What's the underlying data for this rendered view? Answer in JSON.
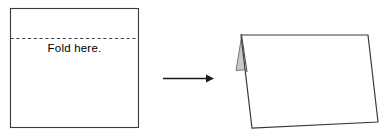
{
  "diagram": {
    "background_color": "#ffffff",
    "stroke_color": "#3a3a3a",
    "fold_crease_color": "#444444",
    "shadow_fill_color": "#c8c8c8",
    "arrow_color": "#1a1a1a"
  },
  "left_figure": {
    "name": "unfolded-sheet",
    "label": "Fold here.",
    "shape": "square",
    "x": 10,
    "y": 8,
    "width": 129,
    "height": 120,
    "fold_line": {
      "name": "fold-crease-line",
      "style": "dashed",
      "y": 38,
      "x_start": 10,
      "x_end": 139
    }
  },
  "arrow": {
    "name": "transformation-arrow",
    "direction": "right",
    "x_start": 163,
    "x_end": 213,
    "y": 78
  },
  "right_figure": {
    "name": "folded-card",
    "shape": "folded-quadrilateral",
    "front_panel": {
      "top_left": [
        241,
        35
      ],
      "top_right": [
        368,
        35
      ],
      "bottom_right": [
        378,
        122
      ],
      "bottom_left": [
        252,
        128
      ]
    },
    "back_panel_sliver": {
      "apex": [
        242,
        34
      ],
      "lower_left": [
        236,
        70
      ],
      "lower_right": [
        248,
        69
      ],
      "fill": "#c8c8c8"
    },
    "spine": {
      "top": [
        241,
        35
      ],
      "bottom": [
        246,
        72
      ]
    }
  }
}
